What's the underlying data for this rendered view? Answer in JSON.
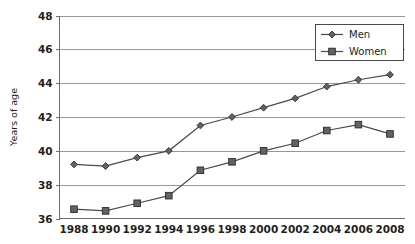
{
  "chart_data": {
    "type": "line",
    "title": "",
    "subtitle": "",
    "xlabel": "",
    "ylabel": "Years of age",
    "ylim": [
      36,
      48
    ],
    "ytick_step": 2,
    "yticks": [
      36,
      38,
      40,
      42,
      44,
      46,
      48
    ],
    "grid": true,
    "grid_axis": "y",
    "legend_position": "top-right",
    "categories": [
      1988,
      1990,
      1992,
      1994,
      1996,
      1998,
      2000,
      2002,
      2004,
      2006,
      2008
    ],
    "xticks": [
      "1988",
      "1990",
      "1992",
      "1994",
      "1996",
      "1998",
      "2000",
      "2002",
      "2004",
      "2006",
      "2008"
    ],
    "series": [
      {
        "name": "Men",
        "marker": "diamond",
        "color": "#636363",
        "values": [
          39.2,
          39.1,
          39.6,
          40.0,
          41.5,
          42.0,
          42.55,
          43.1,
          43.8,
          44.2,
          44.5
        ]
      },
      {
        "name": "Women",
        "marker": "square",
        "color": "#636363",
        "values": [
          36.55,
          36.45,
          36.9,
          37.35,
          38.85,
          39.35,
          40.0,
          40.45,
          41.2,
          41.55,
          41.0
        ]
      }
    ]
  },
  "legend": {
    "entries": [
      {
        "label": "Men",
        "marker": "diamond"
      },
      {
        "label": "Women",
        "marker": "square"
      }
    ]
  },
  "axes": {
    "y_title": "Years of age"
  },
  "colors": {
    "gridline": "#8c8c8c",
    "frame": "#6f6f6f",
    "series_line": "#4a4a4a",
    "marker_fill": "#636363",
    "marker_stroke": "#2b2b2b",
    "text": "#231f20",
    "background": "#ffffff"
  }
}
